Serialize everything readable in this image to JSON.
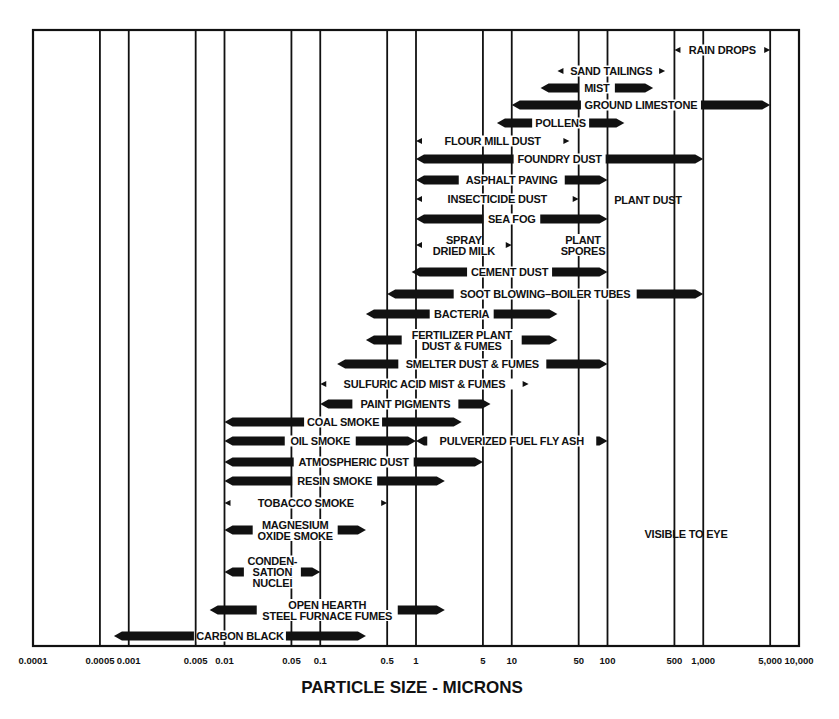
{
  "chart_data": {
    "type": "range-bar",
    "title": "",
    "xlabel": "PARTICLE SIZE - MICRONS",
    "ylabel": "",
    "xscale": "log",
    "xlim": [
      0.0001,
      10000
    ],
    "grid": true,
    "x_ticks": [
      "0.0001",
      "0.0005",
      "0.001",
      "0.005",
      "0.01",
      "0.05",
      "0.1",
      "0.5",
      "1",
      "5",
      "10",
      "50",
      "100",
      "500",
      "1,000",
      "5,000",
      "10,000"
    ],
    "x_tick_values": [
      0.0001,
      0.0005,
      0.001,
      0.005,
      0.01,
      0.05,
      0.1,
      0.5,
      1,
      5,
      10,
      50,
      100,
      500,
      1000,
      5000,
      10000
    ],
    "annotations": [
      "PLANT DUST",
      "VISIBLE TO EYE"
    ],
    "series": [
      {
        "name": "RAIN DROPS",
        "lines": [
          "RAIN DROPS"
        ],
        "min": 500,
        "max": 5000,
        "y": 50,
        "style": "thin"
      },
      {
        "name": "SAND TAILINGS",
        "lines": [
          "SAND TAILINGS"
        ],
        "min": 30,
        "max": 400,
        "y": 71,
        "style": "thin"
      },
      {
        "name": "MIST",
        "lines": [
          "MIST"
        ],
        "min": 20,
        "max": 300,
        "y": 88,
        "style": "thick"
      },
      {
        "name": "GROUND LIMESTONE",
        "lines": [
          "GROUND LIMESTONE"
        ],
        "min": 10,
        "max": 5000,
        "y": 105,
        "style": "thick"
      },
      {
        "name": "POLLENS",
        "lines": [
          "POLLENS"
        ],
        "min": 7,
        "max": 150,
        "y": 123,
        "style": "thick"
      },
      {
        "name": "FLOUR MILL DUST",
        "lines": [
          "FLOUR MILL DUST"
        ],
        "min": 1,
        "max": 40,
        "y": 141,
        "style": "thin"
      },
      {
        "name": "FOUNDRY DUST",
        "lines": [
          "FOUNDRY DUST"
        ],
        "min": 1,
        "max": 1000,
        "y": 159,
        "style": "thick"
      },
      {
        "name": "ASPHALT PAVING",
        "lines": [
          "ASPHALT PAVING"
        ],
        "min": 1,
        "max": 100,
        "y": 180,
        "style": "thick"
      },
      {
        "name": "INSECTICIDE DUST",
        "lines": [
          "INSECTICIDE DUST"
        ],
        "min": 1,
        "max": 50,
        "y": 199,
        "style": "thin"
      },
      {
        "name": "SEA FOG",
        "lines": [
          "SEA FOG"
        ],
        "min": 1,
        "max": 100,
        "y": 219,
        "style": "thick"
      },
      {
        "name": "SPRAY DRIED MILK",
        "lines": [
          "SPRAY",
          "DRIED MILK"
        ],
        "min": 1,
        "max": 10,
        "y": 245,
        "style": "thin"
      },
      {
        "name": "PLANT SPORES",
        "lines": [
          "PLANT",
          "SPORES"
        ],
        "min": null,
        "max": null,
        "y": 245,
        "style": "label"
      },
      {
        "name": "CEMENT DUST",
        "lines": [
          "CEMENT DUST"
        ],
        "min": 0.9,
        "max": 100,
        "y": 272,
        "style": "thick"
      },
      {
        "name": "SOOT BLOWING-BOILER TUBES",
        "lines": [
          "SOOT BLOWING–BOILER TUBES"
        ],
        "min": 0.5,
        "max": 1000,
        "y": 294,
        "style": "thick"
      },
      {
        "name": "BACTERIA",
        "lines": [
          "BACTERIA"
        ],
        "min": 0.3,
        "max": 30,
        "y": 314,
        "style": "thick"
      },
      {
        "name": "FERTILIZER PLANT DUST & FUMES",
        "lines": [
          "FERTILIZER PLANT",
          "DUST & FUMES"
        ],
        "min": 0.3,
        "max": 30,
        "y": 340,
        "style": "thick"
      },
      {
        "name": "SMELTER DUST & FUMES",
        "lines": [
          "SMELTER DUST & FUMES"
        ],
        "min": 0.15,
        "max": 100,
        "y": 364,
        "style": "thick"
      },
      {
        "name": "SULFURIC ACID MIST & FUMES",
        "lines": [
          "SULFURIC ACID MIST & FUMES"
        ],
        "min": 0.1,
        "max": 15,
        "y": 384,
        "style": "thin"
      },
      {
        "name": "PAINT PIGMENTS",
        "lines": [
          "PAINT PIGMENTS"
        ],
        "min": 0.1,
        "max": 6,
        "y": 404,
        "style": "thick"
      },
      {
        "name": "COAL SMOKE",
        "lines": [
          "COAL SMOKE"
        ],
        "min": 0.01,
        "max": 3,
        "y": 422,
        "style": "thick"
      },
      {
        "name": "OIL SMOKE",
        "lines": [
          "OIL SMOKE"
        ],
        "min": 0.01,
        "max": 1,
        "y": 441,
        "style": "thick"
      },
      {
        "name": "PULVERIZED FUEL FLY ASH",
        "lines": [
          "PULVERIZED FUEL FLY ASH"
        ],
        "min": 1,
        "max": 100,
        "y": 441,
        "style": "thick"
      },
      {
        "name": "ATMOSPHERIC DUST",
        "lines": [
          "ATMOSPHERIC DUST"
        ],
        "min": 0.01,
        "max": 5,
        "y": 462,
        "style": "thick"
      },
      {
        "name": "RESIN SMOKE",
        "lines": [
          "RESIN SMOKE"
        ],
        "min": 0.01,
        "max": 2,
        "y": 481,
        "style": "thick"
      },
      {
        "name": "TOBACCO SMOKE",
        "lines": [
          "TOBACCO SMOKE"
        ],
        "min": 0.01,
        "max": 0.5,
        "y": 503,
        "style": "thin"
      },
      {
        "name": "MAGNESIUM OXIDE SMOKE",
        "lines": [
          "MAGNESIUM",
          "OXIDE SMOKE"
        ],
        "min": 0.01,
        "max": 0.3,
        "y": 530,
        "style": "thick"
      },
      {
        "name": "CONDENSATION NUCLEI",
        "lines": [
          "CONDEN-",
          "SATION",
          "NUCLEI"
        ],
        "min": 0.01,
        "max": 0.1,
        "y": 572,
        "style": "thick"
      },
      {
        "name": "OPEN HEARTH STEEL FURNACE FUMES",
        "lines": [
          "OPEN HEARTH",
          "STEEL FURNACE FUMES"
        ],
        "min": 0.007,
        "max": 2,
        "y": 610,
        "style": "thick"
      },
      {
        "name": "CARBON BLACK",
        "lines": [
          "CARBON BLACK"
        ],
        "min": 0.0007,
        "max": 0.3,
        "y": 636,
        "style": "thick"
      }
    ]
  }
}
